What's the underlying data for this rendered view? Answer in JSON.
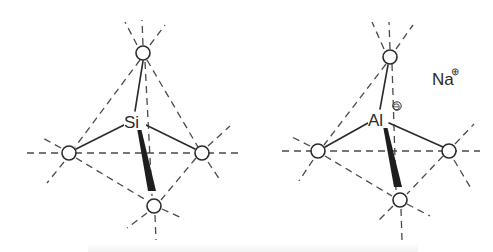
{
  "figure": {
    "type": "tetrahedral coordination diagram",
    "line_color": "#2a2a2a",
    "dash_color": "#4a4a4a",
    "background": "#ffffff"
  },
  "structures": [
    {
      "id": "silicate-tetrahedron",
      "center": {
        "label": "Si",
        "charge": "",
        "x": 133,
        "y": 121
      },
      "oxygens": [
        {
          "label": "O",
          "position": "top",
          "x": 143,
          "y": 53
        },
        {
          "label": "O",
          "position": "left",
          "x": 69,
          "y": 153
        },
        {
          "label": "O",
          "position": "right",
          "x": 202,
          "y": 153
        },
        {
          "label": "O",
          "position": "bottom",
          "x": 154,
          "y": 206
        }
      ],
      "counter_ion": null
    },
    {
      "id": "aluminate-tetrahedron",
      "center": {
        "label": "Al",
        "charge": "⊖",
        "x": 377,
        "y": 119
      },
      "oxygens": [
        {
          "label": "O",
          "position": "top",
          "x": 390,
          "y": 57
        },
        {
          "label": "O",
          "position": "left",
          "x": 318,
          "y": 151
        },
        {
          "label": "O",
          "position": "right",
          "x": 449,
          "y": 151
        },
        {
          "label": "O",
          "position": "bottom",
          "x": 400,
          "y": 200
        }
      ],
      "counter_ion": {
        "label": "Na",
        "charge": "⊕",
        "x": 441,
        "y": 79
      }
    }
  ],
  "caption": {
    "visible": true,
    "legible": false
  }
}
